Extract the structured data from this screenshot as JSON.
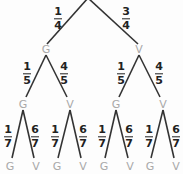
{
  "diagram": {
    "type": "probability-tree",
    "colors": {
      "line": "#333333",
      "node": "#a9a9a9",
      "fraction": "#222222"
    },
    "level1": {
      "nodes": [
        {
          "label": "G"
        },
        {
          "label": "V"
        }
      ],
      "probs": [
        {
          "num": "1",
          "den": "4"
        },
        {
          "num": "3",
          "den": "4"
        }
      ]
    },
    "level2": {
      "nodes": [
        {
          "label": "G"
        },
        {
          "label": "V"
        },
        {
          "label": "G"
        },
        {
          "label": "V"
        }
      ],
      "probs": [
        {
          "num": "1",
          "den": "5"
        },
        {
          "num": "4",
          "den": "5"
        },
        {
          "num": "1",
          "den": "5"
        },
        {
          "num": "4",
          "den": "5"
        }
      ]
    },
    "level3": {
      "nodes": [
        {
          "label": "G"
        },
        {
          "label": "V"
        },
        {
          "label": "G"
        },
        {
          "label": "V"
        },
        {
          "label": "G"
        },
        {
          "label": "V"
        },
        {
          "label": "G"
        },
        {
          "label": "V"
        }
      ],
      "probs": [
        {
          "num": "1",
          "den": "7"
        },
        {
          "num": "6",
          "den": "7"
        },
        {
          "num": "1",
          "den": "7"
        },
        {
          "num": "6",
          "den": "7"
        },
        {
          "num": "1",
          "den": "7"
        },
        {
          "num": "6",
          "den": "7"
        },
        {
          "num": "1",
          "den": "7"
        },
        {
          "num": "6",
          "den": "7"
        }
      ]
    }
  }
}
